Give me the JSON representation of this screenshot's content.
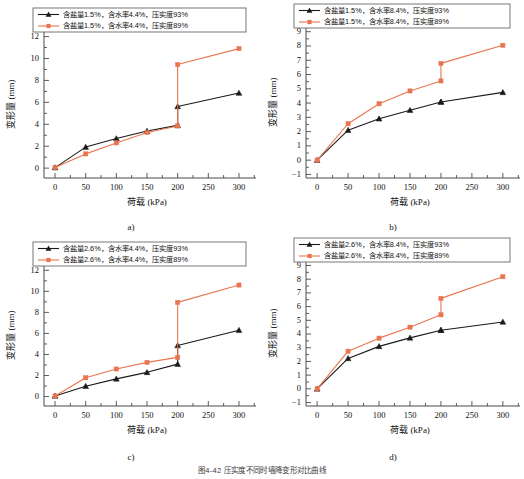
{
  "figure": {
    "caption": "图4-42  压实度不同时墙降变形对比曲线",
    "axis": {
      "xlabel": "荷载 (kPa)",
      "ylabel": "变形量 (mm)"
    },
    "colors": {
      "series_93": "#1a1a1a",
      "series_89": "#e8754f",
      "axis": "#4a4a4a",
      "background": "#ffffff"
    }
  },
  "chart_data": [
    {
      "id": "a",
      "type": "line",
      "panel_label": "a)",
      "title": "",
      "xlabel": "荷载 (kPa)",
      "ylabel": "变形量 (mm)",
      "x": [
        0,
        50,
        100,
        150,
        200,
        200,
        300
      ],
      "xlim": [
        -18,
        318
      ],
      "ylim": [
        -0.9,
        12.6
      ],
      "xticks": [
        0,
        50,
        100,
        150,
        200,
        250,
        300
      ],
      "yticks": [
        0,
        2,
        4,
        6,
        8,
        10,
        12
      ],
      "grid": false,
      "legend_position": "top-left",
      "series": [
        {
          "name": "含盐量1.5%，含水率4.4%，压实度93%",
          "color": "#1a1a1a",
          "marker": "triangle",
          "values": [
            0.05,
            1.92,
            2.7,
            3.38,
            3.9,
            5.62,
            6.85
          ]
        },
        {
          "name": "含盐量1.5%，含水率4.4%，压实度89%",
          "color": "#e8754f",
          "marker": "square",
          "values": [
            0.05,
            1.3,
            2.3,
            3.25,
            3.85,
            9.45,
            10.9
          ]
        }
      ]
    },
    {
      "id": "b",
      "type": "line",
      "panel_label": "b)",
      "title": "",
      "xlabel": "荷载 (kPa)",
      "ylabel": "变形量 (mm)",
      "x": [
        0,
        50,
        100,
        150,
        200,
        200,
        300
      ],
      "xlim": [
        -18,
        318
      ],
      "ylim": [
        -1.25,
        9.4
      ],
      "xticks": [
        0,
        50,
        100,
        150,
        200,
        250,
        300
      ],
      "yticks": [
        -1,
        0,
        1,
        2,
        3,
        4,
        5,
        6,
        7,
        8,
        9
      ],
      "grid": false,
      "legend_position": "top-left",
      "series": [
        {
          "name": "含盐量1.5%，含水率8.4%，压实度93%",
          "color": "#1a1a1a",
          "marker": "triangle",
          "values": [
            0.0,
            2.1,
            2.9,
            3.5,
            4.08,
            4.08,
            4.75
          ]
        },
        {
          "name": "含盐量1.5%，含水率8.4%，压实度89%",
          "color": "#e8754f",
          "marker": "square",
          "values": [
            0.0,
            2.55,
            3.95,
            4.85,
            5.55,
            6.78,
            8.05
          ]
        }
      ]
    },
    {
      "id": "c",
      "type": "line",
      "panel_label": "c)",
      "title": "",
      "xlabel": "荷载 (kPa)",
      "ylabel": "变形量 (mm)",
      "x": [
        0,
        50,
        100,
        150,
        200,
        200,
        300
      ],
      "xlim": [
        -18,
        318
      ],
      "ylim": [
        -0.9,
        12.6
      ],
      "xticks": [
        0,
        50,
        100,
        150,
        200,
        250,
        300
      ],
      "yticks": [
        0,
        2,
        4,
        6,
        8,
        10,
        12
      ],
      "grid": false,
      "legend_position": "top-left",
      "series": [
        {
          "name": "含盐量2.6%，含水率4.4%，压实度93%",
          "color": "#1a1a1a",
          "marker": "triangle",
          "values": [
            0.05,
            0.98,
            1.68,
            2.3,
            3.08,
            4.85,
            6.3
          ]
        },
        {
          "name": "含盐量2.6%，含水率4.4%，压实度89%",
          "color": "#e8754f",
          "marker": "square",
          "values": [
            0.05,
            1.78,
            2.62,
            3.25,
            3.72,
            8.95,
            10.6
          ]
        }
      ]
    },
    {
      "id": "d",
      "type": "line",
      "panel_label": "d)",
      "title": "",
      "xlabel": "荷载 (kPa)",
      "ylabel": "变形量 (mm)",
      "x": [
        0,
        50,
        100,
        150,
        200,
        200,
        300
      ],
      "xlim": [
        -18,
        318
      ],
      "ylim": [
        -1.25,
        9.4
      ],
      "xticks": [
        0,
        50,
        100,
        150,
        200,
        250,
        300
      ],
      "yticks": [
        -1,
        0,
        1,
        2,
        3,
        4,
        5,
        6,
        7,
        8,
        9
      ],
      "grid": false,
      "legend_position": "top-left",
      "series": [
        {
          "name": "含盐量2.6%，含水率8.4%，压实度93%",
          "color": "#1a1a1a",
          "marker": "triangle",
          "values": [
            0.0,
            2.22,
            3.1,
            3.72,
            4.28,
            4.28,
            4.88
          ]
        },
        {
          "name": "含盐量2.6%，含水率8.4%，压实度89%",
          "color": "#e8754f",
          "marker": "square",
          "values": [
            0.0,
            2.75,
            3.7,
            4.5,
            5.4,
            6.6,
            8.18
          ]
        }
      ]
    }
  ]
}
